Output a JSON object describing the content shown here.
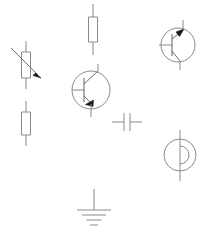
{
  "document": {
    "title": "Electronic circuit symbols sheet",
    "background_color": "#ffffff",
    "width": 207,
    "height": 233
  },
  "style": {
    "stroke_color": "#8a8a8a",
    "stroke_color_dark": "#6e6e6e",
    "arrow_fill": "#1a1a1a",
    "stroke_width": 1,
    "fill_none": "none"
  },
  "symbols": [
    {
      "id": "variable-resistor",
      "name": "variable-resistor",
      "label": "Variable resistor",
      "type": "resistor-variable",
      "orientation": "vertical",
      "position": {
        "x": 26,
        "y": 65
      },
      "body": {
        "width": 9,
        "height": 26
      },
      "lead_length": 11,
      "arrow": {
        "from_x": 11,
        "from_y": 48,
        "to_x": 41,
        "to_y": 78
      }
    },
    {
      "id": "resistor-left",
      "name": "resistor-lower-left",
      "label": "Resistor",
      "type": "resistor",
      "orientation": "vertical",
      "position": {
        "x": 26,
        "y": 123
      },
      "body": {
        "width": 9,
        "height": 23
      },
      "lead_length": 11
    },
    {
      "id": "resistor-top",
      "name": "resistor-top-center",
      "label": "Resistor",
      "type": "resistor",
      "orientation": "vertical",
      "position": {
        "x": 93,
        "y": 29
      },
      "body": {
        "width": 9,
        "height": 25
      },
      "lead_length": 13
    },
    {
      "id": "transistor-npn",
      "name": "transistor-npn",
      "label": "NPN bipolar junction transistor",
      "type": "transistor-npn",
      "position": {
        "x": 91,
        "y": 90
      },
      "circle_radius": 19,
      "base_lead_x": 72,
      "collector_lead_y": 64,
      "emitter_lead_y": 117
    },
    {
      "id": "transistor-pnp",
      "name": "transistor-pnp",
      "label": "PNP bipolar junction transistor",
      "type": "transistor-pnp",
      "position": {
        "x": 178,
        "y": 45
      },
      "circle_radius": 17,
      "base_lead_x": 159,
      "collector_lead_y": 20,
      "emitter_lead_y": 70
    },
    {
      "id": "capacitor",
      "name": "capacitor",
      "label": "Capacitor",
      "type": "capacitor",
      "orientation": "horizontal",
      "position": {
        "x": 127,
        "y": 122
      },
      "plate_height": 18,
      "plate_gap": 6,
      "lead_length": 12
    },
    {
      "id": "source-symbol",
      "name": "current-source",
      "label": "Current source",
      "type": "source-circle",
      "position": {
        "x": 180,
        "y": 155
      },
      "circle_radius": 16,
      "lead_length": 17
    },
    {
      "id": "ground",
      "name": "ground",
      "label": "Ground",
      "type": "ground",
      "position": {
        "x": 94,
        "y": 189
      },
      "stem_length": 21,
      "bars": [
        {
          "width": 34,
          "y_offset": 21
        },
        {
          "width": 24,
          "y_offset": 26
        },
        {
          "width": 15,
          "y_offset": 31
        },
        {
          "width": 8,
          "y_offset": 36
        }
      ]
    }
  ]
}
